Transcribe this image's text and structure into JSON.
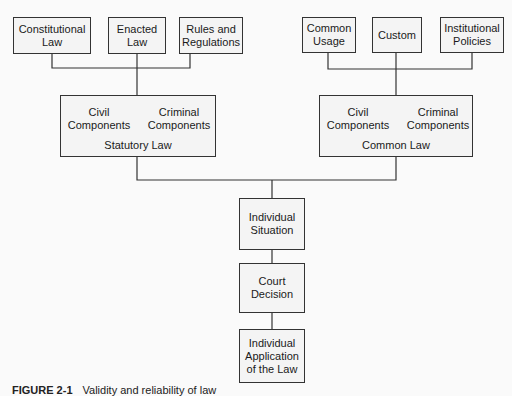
{
  "diagram": {
    "sources_statutory": [
      {
        "id": "constitutional-law",
        "label_line1": "Constitutional",
        "label_line2": "Law"
      },
      {
        "id": "enacted-law",
        "label_line1": "Enacted",
        "label_line2": "Law"
      },
      {
        "id": "rules-regulations",
        "label_line1": "Rules and",
        "label_line2": "Regulations"
      }
    ],
    "sources_common": [
      {
        "id": "common-usage",
        "label_line1": "Common",
        "label_line2": "Usage"
      },
      {
        "id": "custom",
        "label_line1": "Custom",
        "label_line2": ""
      },
      {
        "id": "institutional-policies",
        "label_line1": "Institutional",
        "label_line2": "Policies"
      }
    ],
    "statutory_law": {
      "civil_line1": "Civil",
      "civil_line2": "Components",
      "criminal_line1": "Criminal",
      "criminal_line2": "Components",
      "title": "Statutory Law"
    },
    "common_law": {
      "civil_line1": "Civil",
      "civil_line2": "Components",
      "criminal_line1": "Criminal",
      "criminal_line2": "Components",
      "title": "Common Law"
    },
    "flow": [
      {
        "id": "individual-situation",
        "label_line1": "Individual",
        "label_line2": "Situation",
        "label_line3": ""
      },
      {
        "id": "court-decision",
        "label_line1": "Court",
        "label_line2": "Decision",
        "label_line3": ""
      },
      {
        "id": "individual-application",
        "label_line1": "Individual",
        "label_line2": "Application",
        "label_line3": "of the Law"
      }
    ],
    "caption": {
      "number": "FIGURE 2-1",
      "text": "Validity and reliability of law"
    }
  },
  "colors": {
    "line": "#333333",
    "box_fill": "#f4f4f4",
    "page": "#fafafa"
  }
}
